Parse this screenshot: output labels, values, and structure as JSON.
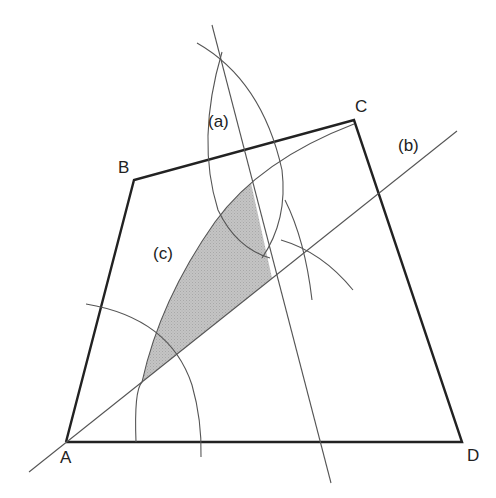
{
  "figure": {
    "vertices": {
      "A": {
        "label": "A",
        "x": 66,
        "y": 442
      },
      "B": {
        "label": "B",
        "x": 134,
        "y": 180
      },
      "C": {
        "label": "C",
        "x": 354,
        "y": 120
      },
      "D": {
        "label": "D",
        "x": 462,
        "y": 442
      }
    },
    "annotations": {
      "a": "(a)",
      "b": "(b)",
      "c": "(c)"
    },
    "colors": {
      "outline": "#222222",
      "construction": "#555555",
      "shaded_region": "#b8b8b8",
      "background": "#ffffff"
    }
  }
}
